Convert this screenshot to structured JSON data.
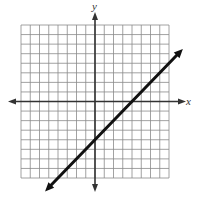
{
  "chart_data": {
    "type": "line",
    "title": "",
    "xlabel": "x",
    "ylabel": "y",
    "xlim": [
      -8,
      8
    ],
    "ylim": [
      -8,
      8
    ],
    "grid": true,
    "grid_step": 1,
    "tick_labels": false,
    "series": [
      {
        "name": "line",
        "equation": "y = x - 4",
        "slope": 1,
        "y_intercept": -4,
        "x_intercept": 4,
        "x": [
          -5.4,
          9.5
        ],
        "y": [
          -9.4,
          5.5
        ],
        "arrows": "both ends"
      }
    ],
    "legend": null
  },
  "colors": {
    "grid": "#8a8a8a",
    "axis": "#333333",
    "line": "#111111",
    "background": "#ffffff"
  },
  "layout": {
    "grid_left": 21,
    "grid_top": 25,
    "grid_right": 169,
    "grid_bottom": 178
  }
}
